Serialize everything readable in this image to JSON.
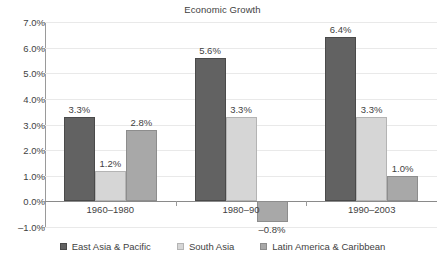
{
  "chart_data": {
    "type": "bar",
    "title": "Economic Growth",
    "xlabel": "",
    "ylabel": "",
    "ylim": [
      -1.0,
      7.0
    ],
    "ytick_step": 1.0,
    "grid": true,
    "legend_position": "bottom",
    "categories": [
      "1960–1980",
      "1980–90",
      "1990–2003"
    ],
    "ytick_labels": [
      "7.0%",
      "6.0%",
      "5.0%",
      "4.0%",
      "3.0%",
      "2.0%",
      "1.0%",
      "0.0%",
      "–1.0%"
    ],
    "ytick_values": [
      7.0,
      6.0,
      5.0,
      4.0,
      3.0,
      2.0,
      1.0,
      0.0,
      -1.0
    ],
    "series": [
      {
        "name": "East Asia & Pacific",
        "color": "#626262",
        "values": [
          3.3,
          5.6,
          6.4
        ],
        "labels": [
          "3.3%",
          "5.6%",
          "6.4%"
        ]
      },
      {
        "name": "South Asia",
        "color": "#d6d6d6",
        "values": [
          1.2,
          3.3,
          3.3
        ],
        "labels": [
          "1.2%",
          "3.3%",
          "3.3%"
        ]
      },
      {
        "name": "Latin America & Caribbean",
        "color": "#a8a8a8",
        "values": [
          2.8,
          -0.8,
          1.0
        ],
        "labels": [
          "2.8%",
          "–0.8%",
          "1.0%"
        ]
      }
    ]
  },
  "legend": {
    "items": [
      {
        "label": "East Asia & Pacific"
      },
      {
        "label": "South Asia"
      },
      {
        "label": "Latin America & Caribbean"
      }
    ]
  }
}
